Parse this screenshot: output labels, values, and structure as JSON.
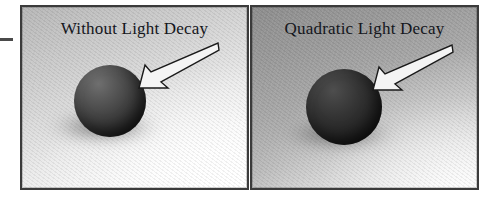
{
  "figure": {
    "name": "light-decay-comparison-figure",
    "panel_count": 2,
    "crop_mark": "—"
  },
  "panels": [
    {
      "id": "without-light-decay",
      "title": "Without Light Decay",
      "background_top_color": "#b8b8b8",
      "background_bottom_color": "#ffffff",
      "sphere_color": "#343434",
      "arrow_label": "arrow pointing at sphere",
      "border_color": "#3b3b3b"
    },
    {
      "id": "quadratic-light-decay",
      "title": "Quadratic Light Decay",
      "background_top_color": "#8f8f8f",
      "background_bottom_color": "#f2f2f2",
      "sphere_color": "#272727",
      "arrow_label": "arrow pointing at sphere",
      "border_color": "#3b3b3b"
    }
  ]
}
